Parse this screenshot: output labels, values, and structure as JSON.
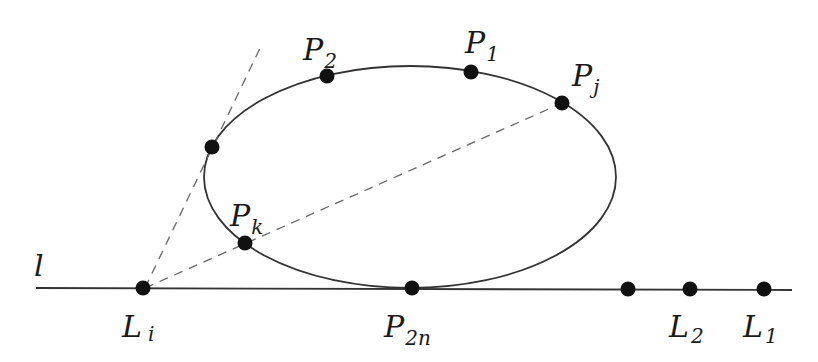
{
  "diagram": {
    "line": {
      "label": "l",
      "x1": 36,
      "y1": 288,
      "x2": 792,
      "y2": 290
    },
    "ellipse": {
      "cx": 410,
      "cy": 177,
      "rx": 206,
      "ry": 111
    },
    "tangent_line": {
      "x1": 145,
      "y1": 288,
      "x2": 262,
      "y2": 44
    },
    "secant_line": {
      "x1": 145,
      "y1": 288,
      "x2": 562,
      "y2": 103
    },
    "points": [
      {
        "id": "P1",
        "base": "P",
        "sub": "1",
        "x": 471,
        "y": 72,
        "lx": 466,
        "ly": 52
      },
      {
        "id": "P2",
        "base": "P",
        "sub": "2",
        "x": 327,
        "y": 76,
        "lx": 303,
        "ly": 57
      },
      {
        "id": "Pj",
        "base": "P",
        "sub": "j",
        "x": 562,
        "y": 103,
        "lx": 572,
        "ly": 86
      },
      {
        "id": "Pk",
        "base": "P",
        "sub": "k",
        "x": 245,
        "y": 243,
        "lx": 230,
        "ly": 224
      },
      {
        "id": "tangent",
        "base": "",
        "sub": "",
        "x": 212,
        "y": 147,
        "lx": 0,
        "ly": 0
      },
      {
        "id": "P2n",
        "base": "P",
        "sub": "2n",
        "x": 412,
        "y": 288,
        "lx": 383,
        "ly": 336
      },
      {
        "id": "Li",
        "base": "L",
        "sub": "i",
        "x": 143,
        "y": 288,
        "lx": 124,
        "ly": 336
      },
      {
        "id": "unlabeled",
        "base": "",
        "sub": "",
        "x": 628,
        "y": 289,
        "lx": 0,
        "ly": 0
      },
      {
        "id": "L2",
        "base": "L",
        "sub": "2",
        "x": 690,
        "y": 289,
        "lx": 669,
        "ly": 336
      },
      {
        "id": "L1",
        "base": "L",
        "sub": "1",
        "x": 764,
        "y": 289,
        "lx": 743,
        "ly": 336
      }
    ],
    "labels": {
      "line_l": "l",
      "P1": "P",
      "P1_sub": "1",
      "P2": "P",
      "P2_sub": "2",
      "Pj": "P",
      "Pj_sub": "j",
      "Pk": "P",
      "Pk_sub": "k",
      "P2n": "P",
      "P2n_sub": "2n",
      "Li": "L",
      "Li_sub": "i",
      "L2": "L",
      "L2_sub": "2",
      "L1": "L",
      "L1_sub": "1"
    },
    "colors": {
      "stroke": "#333333",
      "dash": "#666666",
      "point": "#111111"
    }
  }
}
